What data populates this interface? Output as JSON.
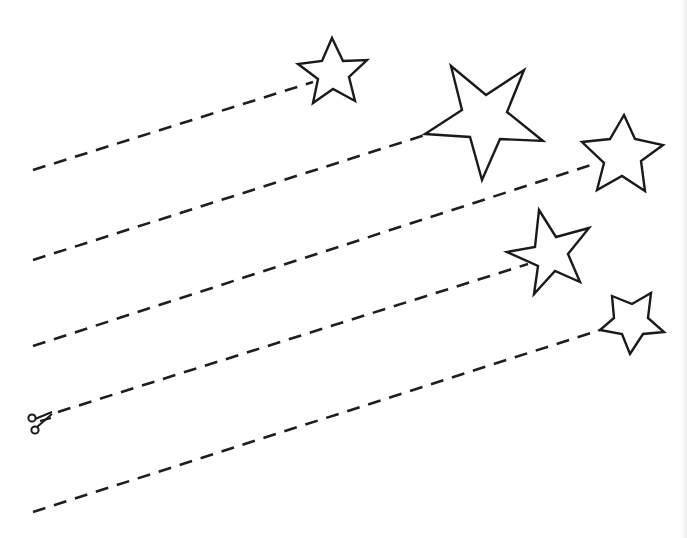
{
  "worksheet": {
    "type": "scissor-cutting practice",
    "colors": {
      "background": "#ffffff",
      "line": "#1e1e1e",
      "star_outline": "#1a1a1a",
      "star_fill": "#ffffff"
    },
    "icon": "scissors-icon",
    "cut_lines": [
      {
        "id": 1,
        "from": [
          33,
          170
        ],
        "to": [
          313,
          82
        ]
      },
      {
        "id": 2,
        "from": [
          33,
          260
        ],
        "to": [
          425,
          135
        ]
      },
      {
        "id": 3,
        "from": [
          33,
          346
        ],
        "to": [
          597,
          163
        ]
      },
      {
        "id": 4,
        "from": [
          58,
          412
        ],
        "to": [
          528,
          264
        ]
      },
      {
        "id": 5,
        "from": [
          33,
          512
        ],
        "to": [
          600,
          330
        ]
      }
    ],
    "stars": [
      {
        "id": 1,
        "points": "332,38 343,61 367,60 349,77 355,101 333,89 313,103 318,79 298,64 322,61"
      },
      {
        "id": 2,
        "points": "451,66 486,95 524,70 507,112 543,141 500,139 482,180 470,137 425,134 462,110"
      },
      {
        "id": 3,
        "points": "624,115 635,139 663,145 641,161 645,191 622,176 597,190 604,163 582,142 610,139"
      },
      {
        "id": 4,
        "points": "539,210 556,237 589,228 568,254 580,282 555,271 534,294 538,266 507,252 535,247"
      },
      {
        "id": 5,
        "points": "612,296 632,304 651,293 648,318 664,332 643,334 630,354 622,334 600,330 614,318"
      }
    ]
  }
}
